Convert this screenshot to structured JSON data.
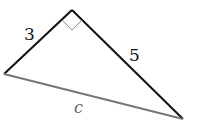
{
  "figure": {
    "type": "right-triangle",
    "labels": {
      "leg_a": "3",
      "leg_b": "5",
      "hypotenuse": "c"
    },
    "colors": {
      "legs": "#111111",
      "hypotenuse": "#777777",
      "right_angle_mark": "#888888"
    }
  }
}
